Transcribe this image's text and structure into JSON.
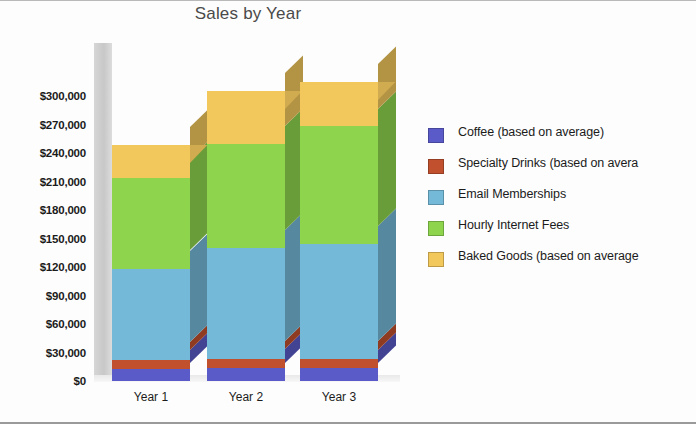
{
  "chart_data": {
    "type": "bar",
    "subtype": "stacked-3d-column",
    "title": "Sales by Year",
    "xlabel": "",
    "ylabel": "",
    "categories": [
      "Year 1",
      "Year 2",
      "Year 3"
    ],
    "ylim": [
      0,
      300000
    ],
    "ytick_labels": [
      "$300,000",
      "$270,000",
      "$240,000",
      "$210,000",
      "$180,000",
      "$150,000",
      "$120,000",
      "$90,000",
      "$60,000",
      "$30,000",
      "$0"
    ],
    "ytick_values": [
      300000,
      270000,
      240000,
      210000,
      180000,
      150000,
      120000,
      90000,
      60000,
      30000,
      0
    ],
    "ytick_interval": 30000,
    "grid": false,
    "legend_position": "right",
    "series": [
      {
        "name": "Coffee (based on average)",
        "color": "#5a5ac8",
        "values": [
          13000,
          14000,
          14000
        ]
      },
      {
        "name": "Specialty Drinks (based on average)",
        "color": "#c1502e",
        "values": [
          9000,
          9000,
          9000
        ]
      },
      {
        "name": "Email Memberships",
        "color": "#74b9d8",
        "values": [
          96000,
          117000,
          121000
        ]
      },
      {
        "name": "Hourly Internet Fees",
        "color": "#8ed44d",
        "values": [
          96000,
          109000,
          124000
        ]
      },
      {
        "name": "Baked Goods (based on average)",
        "color": "#f2c75c",
        "values": [
          34000,
          56000,
          47000
        ]
      }
    ],
    "totals": [
      248000,
      305000,
      315000
    ]
  },
  "legend": {
    "items": [
      {
        "label": "Coffee (based on average)",
        "color": "#5a5ac8"
      },
      {
        "label": "Specialty Drinks (based on avera",
        "color": "#c1502e"
      },
      {
        "label": "Email Memberships",
        "color": "#74b9d8"
      },
      {
        "label": "Hourly Internet Fees",
        "color": "#8ed44d"
      },
      {
        "label": "Baked Goods (based on average",
        "color": "#f2c75c"
      }
    ]
  }
}
